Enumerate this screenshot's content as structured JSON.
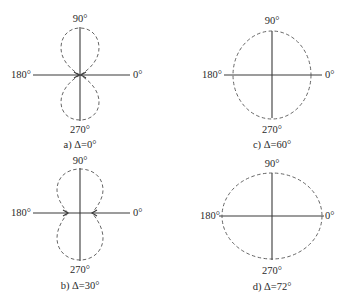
{
  "figure": {
    "panels": [
      {
        "id": "a",
        "caption": "a) Δ=0°",
        "shape": "figure-eight",
        "labels": {
          "top": "90°",
          "left": "180°",
          "right": "0°",
          "bottom": "270°"
        }
      },
      {
        "id": "b",
        "caption": "b) Δ=30°",
        "shape": "figure-eight-with-null-gap",
        "labels": {
          "top": "90°",
          "left": "180°",
          "right": "0°",
          "bottom": "270°"
        }
      },
      {
        "id": "c",
        "caption": "c) Δ=60°",
        "shape": "near-circle",
        "labels": {
          "top": "90°",
          "left": "180°",
          "right": "0°",
          "bottom": "270°"
        }
      },
      {
        "id": "d",
        "caption": "d) Δ=72°",
        "shape": "horizontal-ellipse",
        "labels": {
          "top": "90°",
          "left": "180°",
          "right": "0°",
          "bottom": "270°"
        }
      }
    ]
  }
}
